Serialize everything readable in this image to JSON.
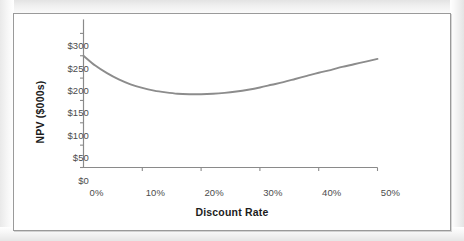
{
  "chart_data": {
    "type": "line",
    "title": "",
    "xlabel": "Discount Rate",
    "ylabel": "NPV ($000s)",
    "xlim": [
      0,
      50
    ],
    "ylim": [
      0,
      300
    ],
    "grid": false,
    "legend": "none",
    "xtick_labels": [
      "0%",
      "10%",
      "20%",
      "30%",
      "40%",
      "50%"
    ],
    "xtick_values": [
      0,
      10,
      20,
      30,
      40,
      50
    ],
    "ytick_labels": [
      "$0",
      "$50",
      "$100",
      "$150",
      "$200",
      "$250",
      "$300"
    ],
    "ytick_values": [
      0,
      50,
      100,
      150,
      200,
      250,
      300
    ],
    "series": [
      {
        "name": "NPV",
        "color": "#8c8c8c",
        "x": [
          0,
          2,
          4,
          6,
          8,
          10,
          12,
          14,
          16,
          18,
          20,
          22,
          24,
          26,
          28,
          30,
          32,
          34,
          36,
          38,
          40,
          42,
          44,
          46,
          48,
          50
        ],
        "values": [
          250,
          228,
          211,
          197,
          186,
          178,
          172,
          168,
          165,
          164,
          164,
          165,
          167,
          170,
          174,
          179,
          185,
          191,
          198,
          205,
          212,
          218,
          225,
          231,
          237,
          243
        ]
      }
    ],
    "annotations": [
      {
        "text": "minimum NPV near 19% discount rate, approx $164K"
      }
    ]
  },
  "axis": {
    "y_tick_labels": [
      "$300",
      "$250",
      "$200",
      "$150",
      "$100",
      "$50",
      "$0"
    ],
    "x_tick_labels": [
      "0%",
      "10%",
      "20%",
      "30%",
      "40%",
      "50%"
    ],
    "x_title": "Discount Rate",
    "y_title": "NPV ($000s)"
  },
  "style": {
    "line_color": "#8c8c8c",
    "axis_color": "#8a8a8a",
    "frame_color": "#9a9a9a",
    "tick_text_color": "#4c4c4c",
    "title_text_color": "#1c1c1c",
    "plot_background": "#ffffff"
  }
}
